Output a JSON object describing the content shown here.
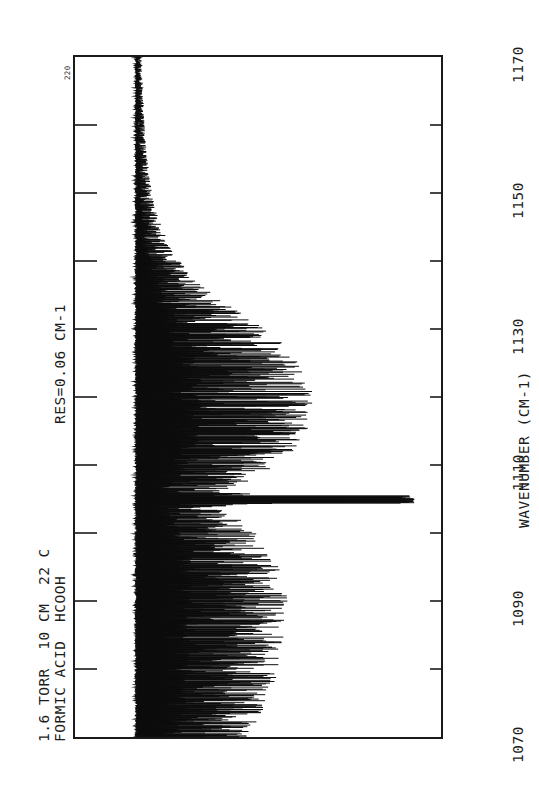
{
  "figure": {
    "header_line1": "FORMIC ACID  HCOOH",
    "header_line2": "1.6 TORR  10 CM  22 C",
    "resolution_label": "RES=0.06 CM-1",
    "scale_marker": "220",
    "axis_title": "WAVENUMBER (CM-1)"
  },
  "chart_data": {
    "type": "line",
    "title": "FORMIC ACID  HCOOH",
    "subtitle": "1.6 TORR  10 CM  22 C",
    "annotations": [
      "RES=0.06 CM-1",
      "220"
    ],
    "xlabel": "WAVENUMBER (CM-1)",
    "ylabel": "",
    "xlim": [
      1070,
      1170
    ],
    "ylim": [
      0,
      220
    ],
    "grid": false,
    "legend": null,
    "orientation": "rotated-90-ccw",
    "xtick_labels": [
      "1070",
      "1090",
      "1110",
      "1130",
      "1150",
      "1170"
    ],
    "xtick_values": [
      1070,
      1090,
      1110,
      1130,
      1150,
      1170
    ],
    "xtick_minor_values": [
      1080,
      1090,
      1100,
      1110,
      1120,
      1130,
      1140,
      1150,
      1160
    ],
    "baseline_value": 205,
    "q_branch_center": 1105.0,
    "q_branch_depth_value": 18,
    "band_envelope": {
      "description": "Rotationally resolved nu6 C-O-H bend band of HCOOH with sharp Q branch at 1105 cm-1 and P/R branch clusters",
      "x": [
        1070,
        1072,
        1074,
        1076,
        1078,
        1080,
        1082,
        1084,
        1086,
        1088,
        1090,
        1092,
        1094,
        1096,
        1098,
        1100,
        1102,
        1103,
        1104,
        1105,
        1106,
        1107,
        1108,
        1110,
        1112,
        1114,
        1116,
        1118,
        1120,
        1122,
        1124,
        1126,
        1128,
        1130,
        1132,
        1134,
        1136,
        1138,
        1140,
        1142,
        1144,
        1146,
        1148,
        1150,
        1155,
        1160,
        1165,
        1170
      ],
      "envelope_min": [
        130,
        124,
        120,
        116,
        112,
        110,
        108,
        106,
        105,
        104,
        103,
        104,
        106,
        110,
        116,
        124,
        134,
        142,
        150,
        18,
        150,
        140,
        126,
        112,
        100,
        92,
        88,
        86,
        86,
        88,
        92,
        98,
        106,
        118,
        132,
        146,
        158,
        168,
        176,
        182,
        186,
        190,
        193,
        195,
        198,
        200,
        201,
        202
      ],
      "envelope_max": [
        207,
        207,
        207,
        207,
        207,
        207,
        207,
        207,
        207,
        207,
        207,
        207,
        207,
        207,
        207,
        207,
        207,
        207,
        207,
        207,
        207,
        207,
        207,
        207,
        207,
        207,
        207,
        207,
        207,
        207,
        207,
        207,
        207,
        207,
        207,
        207,
        207,
        207,
        207,
        207,
        207,
        207,
        207,
        207,
        207,
        207,
        207,
        207
      ]
    }
  }
}
